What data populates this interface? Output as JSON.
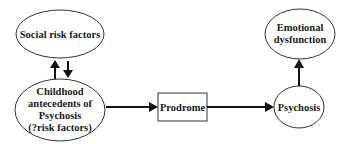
{
  "diagram": {
    "type": "flow",
    "nodes": {
      "social": {
        "shape": "ellipse",
        "lines": [
          "Social risk factors"
        ]
      },
      "childhood": {
        "shape": "ellipse",
        "lines": [
          "Childhood",
          "antecedents of",
          "Psychosis",
          "(?risk factors)"
        ]
      },
      "prodrome": {
        "shape": "rectangle",
        "lines": [
          "Prodrome"
        ]
      },
      "psychosis": {
        "shape": "ellipse",
        "lines": [
          "Psychosis"
        ]
      },
      "emotional": {
        "shape": "ellipse",
        "lines": [
          "Emotional",
          "dysfunction"
        ]
      }
    },
    "edges": [
      {
        "from": "childhood",
        "to": "social",
        "direction": "up"
      },
      {
        "from": "social",
        "to": "childhood",
        "direction": "down"
      },
      {
        "from": "childhood",
        "to": "prodrome",
        "direction": "right"
      },
      {
        "from": "prodrome",
        "to": "psychosis",
        "direction": "right"
      },
      {
        "from": "psychosis",
        "to": "emotional",
        "direction": "up"
      }
    ],
    "colors": {
      "stroke": "#333333",
      "arrow": "#111111",
      "text": "#1a1a1a",
      "background": "#ffffff"
    }
  }
}
